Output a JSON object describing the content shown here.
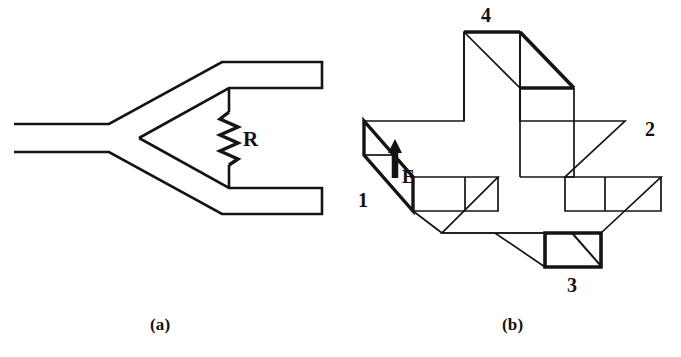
{
  "figure": {
    "type": "technical-line-diagram",
    "background_color": "#ffffff",
    "line_color": "#141414",
    "panels": [
      {
        "id": "a",
        "caption": "(a)",
        "description": "Y-shaped planar waveguide / bifurcated duct with a resistor bridging the two output arms",
        "labels": [
          {
            "name": "resistor-label",
            "text": "R"
          }
        ]
      },
      {
        "id": "b",
        "caption": "(b)",
        "description": "Isometric view of a cross-shaped slab body with an upright fin, four numbered faces and an excitation arrow",
        "labels": [
          {
            "name": "face-label-1",
            "text": "1"
          },
          {
            "name": "face-label-2",
            "text": "2"
          },
          {
            "name": "face-label-3",
            "text": "3"
          },
          {
            "name": "face-label-4",
            "text": "4"
          },
          {
            "name": "excitation-label",
            "text": "E"
          }
        ]
      }
    ]
  },
  "panel_a": {
    "caption": "(a)",
    "resistor_label": "R"
  },
  "panel_b": {
    "caption": "(b)",
    "excitation_label": "E",
    "face_1": "1",
    "face_2": "2",
    "face_3": "3",
    "face_4": "4"
  }
}
